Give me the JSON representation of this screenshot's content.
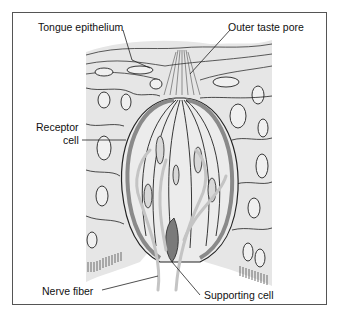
{
  "figure": {
    "labels": {
      "tongue_epithelium": "Tongue epithelium",
      "outer_taste_pore": "Outer taste pore",
      "receptor_cell_line1": "Receptor",
      "receptor_cell_line2": "cell",
      "nerve_fiber": "Nerve fiber",
      "supporting_cell": "Supporting cell"
    },
    "colors": {
      "tissue_fill": "#e6e6e6",
      "outline": "#222222",
      "receptor_band": "#8a8a8a",
      "nerve_fiber": "#c4c4c4",
      "frame": "#555555"
    }
  }
}
